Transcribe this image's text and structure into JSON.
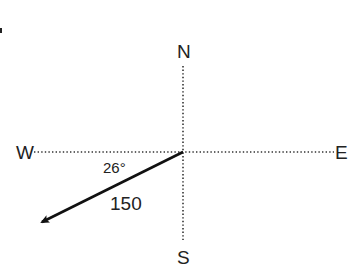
{
  "diagram": {
    "type": "vector-compass",
    "directions": {
      "north": "N",
      "south": "S",
      "east": "E",
      "west": "W"
    },
    "vector": {
      "angle_label": "26°",
      "magnitude_label": "150",
      "reference": "W",
      "rotation": "south of west"
    },
    "colors": {
      "axis": "#333333",
      "vector": "#111111",
      "text": "#222222",
      "background": "#ffffff"
    }
  }
}
